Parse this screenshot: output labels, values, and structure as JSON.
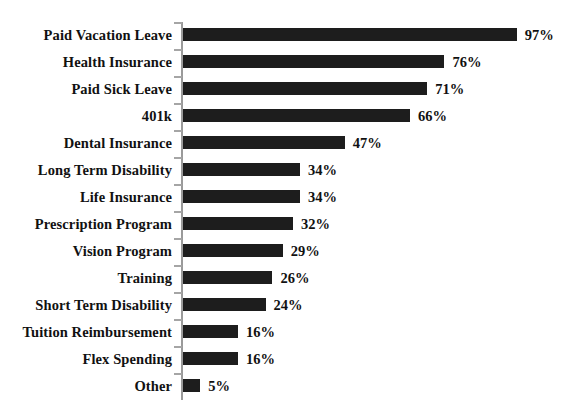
{
  "chart_data": {
    "type": "bar",
    "orientation": "horizontal",
    "title": "",
    "subtitle": "",
    "xlabel": "",
    "ylabel": "",
    "xlim": [
      0,
      100
    ],
    "grid": false,
    "legend": null,
    "value_suffix": "%",
    "categories": [
      "Paid Vacation Leave",
      "Health Insurance",
      "Paid Sick Leave",
      "401k",
      "Dental Insurance",
      "Long Term Disability",
      "Life Insurance",
      "Prescription Program",
      "Vision Program",
      "Training",
      "Short Term Disability",
      "Tuition Reimbursement",
      "Flex Spending",
      "Other"
    ],
    "values": [
      97,
      76,
      71,
      66,
      47,
      34,
      34,
      32,
      29,
      26,
      24,
      16,
      16,
      5
    ],
    "value_labels": [
      "97%",
      "76%",
      "71%",
      "66%",
      "47%",
      "34%",
      "34%",
      "32%",
      "29%",
      "26%",
      "24%",
      "16%",
      "16%",
      "5%"
    ],
    "bar_color": "#1d1d1d",
    "axis_color": "#9a9a9a",
    "background_color": "#ffffff",
    "text_color": "#111111"
  }
}
